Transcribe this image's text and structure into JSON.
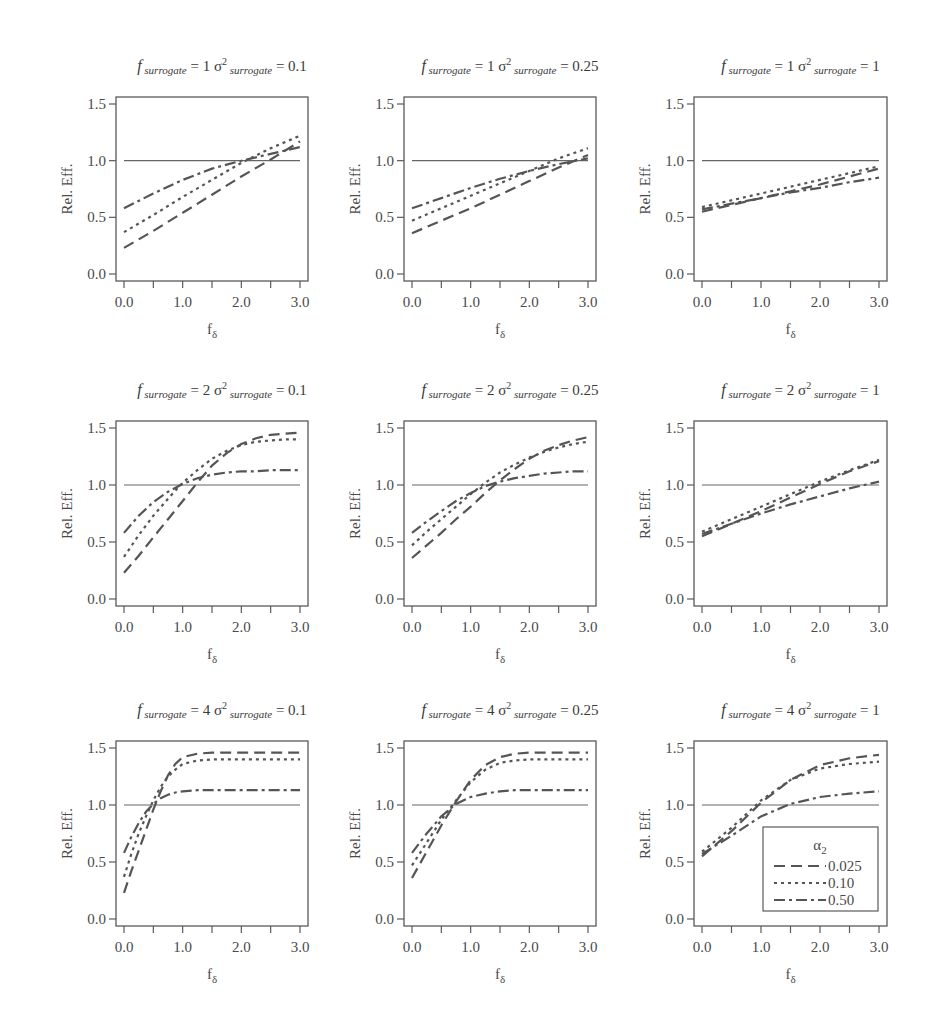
{
  "figure": {
    "ylabel": "Rel. Eff.",
    "xlabel_main": "f",
    "xlabel_sub": "δ",
    "yticks": [
      0.0,
      0.5,
      1.0,
      1.5
    ],
    "ytick_labels": [
      "0.0",
      "0.5",
      "1.0",
      "1.5"
    ],
    "xticks_major": [
      0.0,
      1.0,
      2.0,
      3.0
    ],
    "xtick_labels": [
      "0.0",
      "1.0",
      "2.0",
      "3.0"
    ],
    "xticks_minor": [
      0.5,
      1.5,
      2.5
    ],
    "line_color": "#555555",
    "frame_color": "#5a5a5a",
    "reference_line": 1.0,
    "legend": {
      "title_main": "α",
      "title_sub": "2",
      "entries": [
        {
          "label": "0.025",
          "style": "dashed"
        },
        {
          "label": "0.10",
          "style": "dotted"
        },
        {
          "label": "0.50",
          "style": "dashdot"
        }
      ]
    }
  },
  "chart_data": [
    {
      "type": "line",
      "title": "f surrogate = 1 σ² surrogate = 0.1",
      "f_surrogate": "1",
      "sigma2_surrogate": "0.1",
      "xlabel": "fδ",
      "ylabel": "Rel. Eff.",
      "xlim": [
        0,
        3
      ],
      "ylim": [
        0,
        1.5
      ],
      "x": [
        0,
        0.5,
        1.0,
        1.5,
        2.0,
        2.5,
        3.0
      ],
      "series": [
        {
          "name": "0.025",
          "values": [
            0.23,
            0.38,
            0.54,
            0.7,
            0.86,
            1.01,
            1.17
          ]
        },
        {
          "name": "0.10",
          "values": [
            0.37,
            0.52,
            0.68,
            0.83,
            0.98,
            1.11,
            1.22
          ]
        },
        {
          "name": "0.50",
          "values": [
            0.58,
            0.71,
            0.83,
            0.93,
            1.0,
            1.06,
            1.12
          ]
        }
      ]
    },
    {
      "type": "line",
      "title": "f surrogate = 1 σ² surrogate = 0.25",
      "f_surrogate": "1",
      "sigma2_surrogate": "0.25",
      "xlabel": "fδ",
      "ylabel": "Rel. Eff.",
      "xlim": [
        0,
        3
      ],
      "ylim": [
        0,
        1.5
      ],
      "x": [
        0,
        0.5,
        1.0,
        1.5,
        2.0,
        2.5,
        3.0
      ],
      "series": [
        {
          "name": "0.025",
          "values": [
            0.36,
            0.47,
            0.58,
            0.7,
            0.82,
            0.94,
            1.05
          ]
        },
        {
          "name": "0.10",
          "values": [
            0.47,
            0.58,
            0.69,
            0.8,
            0.91,
            1.02,
            1.11
          ]
        },
        {
          "name": "0.50",
          "values": [
            0.58,
            0.67,
            0.76,
            0.84,
            0.91,
            0.97,
            1.02
          ]
        }
      ]
    },
    {
      "type": "line",
      "title": "f surrogate = 1 σ² surrogate = 1",
      "f_surrogate": "1",
      "sigma2_surrogate": "1",
      "xlabel": "fδ",
      "ylabel": "Rel. Eff.",
      "xlim": [
        0,
        3
      ],
      "ylim": [
        0,
        1.5
      ],
      "x": [
        0,
        0.5,
        1.0,
        1.5,
        2.0,
        2.5,
        3.0
      ],
      "series": [
        {
          "name": "0.025",
          "values": [
            0.55,
            0.61,
            0.67,
            0.73,
            0.79,
            0.86,
            0.93
          ]
        },
        {
          "name": "0.10",
          "values": [
            0.59,
            0.65,
            0.71,
            0.77,
            0.83,
            0.89,
            0.95
          ]
        },
        {
          "name": "0.50",
          "values": [
            0.57,
            0.62,
            0.67,
            0.72,
            0.76,
            0.81,
            0.85
          ]
        }
      ]
    },
    {
      "type": "line",
      "title": "f surrogate = 2 σ² surrogate = 0.1",
      "f_surrogate": "2",
      "sigma2_surrogate": "0.1",
      "xlabel": "fδ",
      "ylabel": "Rel. Eff.",
      "xlim": [
        0,
        3
      ],
      "ylim": [
        0,
        1.5
      ],
      "x": [
        0,
        0.25,
        0.5,
        0.75,
        1.0,
        1.25,
        1.5,
        1.75,
        2.0,
        2.25,
        2.5,
        2.75,
        3.0
      ],
      "series": [
        {
          "name": "0.025",
          "values": [
            0.23,
            0.38,
            0.54,
            0.7,
            0.86,
            1.02,
            1.17,
            1.28,
            1.36,
            1.41,
            1.44,
            1.45,
            1.46
          ]
        },
        {
          "name": "0.10",
          "values": [
            0.37,
            0.56,
            0.73,
            0.88,
            1.02,
            1.13,
            1.23,
            1.3,
            1.35,
            1.38,
            1.39,
            1.4,
            1.4
          ]
        },
        {
          "name": "0.50",
          "values": [
            0.58,
            0.73,
            0.85,
            0.94,
            1.01,
            1.06,
            1.09,
            1.11,
            1.12,
            1.12,
            1.13,
            1.13,
            1.13
          ]
        }
      ]
    },
    {
      "type": "line",
      "title": "f surrogate = 2 σ² surrogate = 0.25",
      "f_surrogate": "2",
      "sigma2_surrogate": "0.25",
      "xlabel": "fδ",
      "ylabel": "Rel. Eff.",
      "xlim": [
        0,
        3
      ],
      "ylim": [
        0,
        1.5
      ],
      "x": [
        0,
        0.25,
        0.5,
        0.75,
        1.0,
        1.25,
        1.5,
        1.75,
        2.0,
        2.25,
        2.5,
        2.75,
        3.0
      ],
      "series": [
        {
          "name": "0.025",
          "values": [
            0.36,
            0.47,
            0.58,
            0.7,
            0.81,
            0.93,
            1.04,
            1.14,
            1.23,
            1.3,
            1.35,
            1.39,
            1.42
          ]
        },
        {
          "name": "0.10",
          "values": [
            0.47,
            0.59,
            0.7,
            0.81,
            0.92,
            1.02,
            1.11,
            1.18,
            1.24,
            1.29,
            1.33,
            1.36,
            1.38
          ]
        },
        {
          "name": "0.50",
          "values": [
            0.58,
            0.68,
            0.77,
            0.86,
            0.93,
            0.99,
            1.03,
            1.06,
            1.08,
            1.1,
            1.11,
            1.12,
            1.12
          ]
        }
      ]
    },
    {
      "type": "line",
      "title": "f surrogate = 2 σ² surrogate = 1",
      "f_surrogate": "2",
      "sigma2_surrogate": "1",
      "xlabel": "fδ",
      "ylabel": "Rel. Eff.",
      "xlim": [
        0,
        3
      ],
      "ylim": [
        0,
        1.5
      ],
      "x": [
        0,
        0.5,
        1.0,
        1.5,
        2.0,
        2.5,
        3.0
      ],
      "series": [
        {
          "name": "0.025",
          "values": [
            0.55,
            0.66,
            0.77,
            0.89,
            1.01,
            1.12,
            1.21
          ]
        },
        {
          "name": "0.10",
          "values": [
            0.59,
            0.7,
            0.81,
            0.92,
            1.03,
            1.13,
            1.22
          ]
        },
        {
          "name": "0.50",
          "values": [
            0.57,
            0.66,
            0.75,
            0.83,
            0.9,
            0.97,
            1.03
          ]
        }
      ]
    },
    {
      "type": "line",
      "title": "f surrogate = 4 σ² surrogate = 0.1",
      "f_surrogate": "4",
      "sigma2_surrogate": "0.1",
      "xlabel": "fδ",
      "ylabel": "Rel. Eff.",
      "xlim": [
        0,
        3
      ],
      "ylim": [
        0,
        1.5
      ],
      "x": [
        0,
        0.125,
        0.25,
        0.375,
        0.5,
        0.625,
        0.75,
        0.875,
        1.0,
        1.25,
        1.5,
        2.0,
        2.5,
        3.0
      ],
      "series": [
        {
          "name": "0.025",
          "values": [
            0.23,
            0.42,
            0.6,
            0.78,
            0.96,
            1.12,
            1.26,
            1.36,
            1.42,
            1.45,
            1.46,
            1.46,
            1.46,
            1.46
          ]
        },
        {
          "name": "0.10",
          "values": [
            0.37,
            0.57,
            0.75,
            0.9,
            1.04,
            1.16,
            1.25,
            1.31,
            1.36,
            1.39,
            1.4,
            1.4,
            1.4,
            1.4
          ]
        },
        {
          "name": "0.50",
          "values": [
            0.58,
            0.72,
            0.84,
            0.94,
            1.01,
            1.06,
            1.09,
            1.11,
            1.12,
            1.13,
            1.13,
            1.13,
            1.13,
            1.13
          ]
        }
      ]
    },
    {
      "type": "line",
      "title": "f surrogate = 4 σ² surrogate = 0.25",
      "f_surrogate": "4",
      "sigma2_surrogate": "0.25",
      "xlabel": "fδ",
      "ylabel": "Rel. Eff.",
      "xlim": [
        0,
        3
      ],
      "ylim": [
        0,
        1.5
      ],
      "x": [
        0,
        0.25,
        0.5,
        0.75,
        1.0,
        1.25,
        1.5,
        1.75,
        2.0,
        2.5,
        3.0
      ],
      "series": [
        {
          "name": "0.025",
          "values": [
            0.36,
            0.59,
            0.82,
            1.03,
            1.22,
            1.35,
            1.42,
            1.45,
            1.46,
            1.46,
            1.46
          ]
        },
        {
          "name": "0.10",
          "values": [
            0.47,
            0.67,
            0.87,
            1.04,
            1.2,
            1.31,
            1.37,
            1.39,
            1.4,
            1.4,
            1.4
          ]
        },
        {
          "name": "0.50",
          "values": [
            0.58,
            0.75,
            0.9,
            1.01,
            1.07,
            1.1,
            1.12,
            1.13,
            1.13,
            1.13,
            1.13
          ]
        }
      ]
    },
    {
      "type": "line",
      "title": "f surrogate = 4 σ² surrogate = 1",
      "f_surrogate": "4",
      "sigma2_surrogate": "1",
      "xlabel": "fδ",
      "ylabel": "Rel. Eff.",
      "xlim": [
        0,
        3
      ],
      "ylim": [
        0,
        1.5
      ],
      "x": [
        0,
        0.5,
        1.0,
        1.5,
        2.0,
        2.5,
        3.0
      ],
      "series": [
        {
          "name": "0.025",
          "values": [
            0.55,
            0.77,
            1.02,
            1.22,
            1.35,
            1.41,
            1.44
          ]
        },
        {
          "name": "0.10",
          "values": [
            0.59,
            0.8,
            1.04,
            1.22,
            1.32,
            1.36,
            1.38
          ]
        },
        {
          "name": "0.50",
          "values": [
            0.57,
            0.73,
            0.9,
            1.01,
            1.07,
            1.1,
            1.12
          ]
        }
      ]
    }
  ]
}
